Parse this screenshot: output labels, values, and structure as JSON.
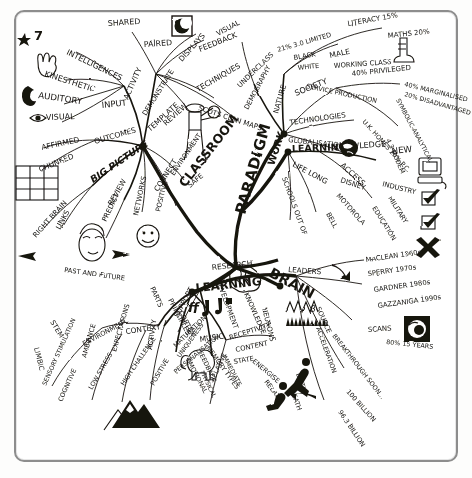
{
  "document": {
    "type": "hand-drawn-mind-map",
    "title": "PARADIGM",
    "ink_color": "#17140f",
    "paper_color": "#ffffff",
    "frame_color": "#8d8d8d"
  },
  "center": {
    "label": "PARADIGM"
  },
  "branches": [
    {
      "id": "classroom",
      "label": "CLASSROOM",
      "direction": "upper-left",
      "children": [
        "INTELLIGENCES",
        "7",
        "KINESTHETIC",
        "AUDITORY",
        "VISUAL",
        "INPUT",
        "ACTIVITY",
        "SHARED",
        "PAIRED",
        "DISPLAYS",
        "VISUAL",
        "FEEDBACK",
        "DEMONSTRATE",
        "REVIEW",
        "TECHNIQUES",
        "SCOTS CLAN MAPS",
        "AFFIRMED",
        "OUTCOMES",
        "CHUNKED",
        "BIG PICTURE",
        "RIGHT BRAIN",
        "LINKS",
        "REVIEW",
        "PREDICT",
        "NETWORKS",
        "CONNECT",
        "ENVIRONMENT",
        "POSITIVE",
        "SAFE",
        "TEMPLATE",
        "PAST AND FUTURE"
      ]
    },
    {
      "id": "work",
      "label": "WORK",
      "direction": "upper-right",
      "children": [
        "DEMOGRAPHY",
        "NATURE",
        "SOCIETY",
        "TECHNOLOGIES",
        "GLOBALISATION",
        "UNDERCLASS",
        "21% 3.0 LIMITED",
        "BLACK",
        "WHITE",
        "MALE",
        "WORKING CLASS",
        "LITERACY 15%",
        "MATHS 20%",
        "40% PRIVILEGED",
        "40% MARGINALISED",
        "20% DISADVANTAGED",
        "SERVICE PRODUCTION",
        "SYMBOLIC-ANALYTICAL",
        "U.K. HOMES 20% P.C.",
        "4.3 MODEM"
      ]
    },
    {
      "id": "learning-knowledge",
      "label": "LEARNING",
      "direction": "right",
      "children": [
        "KNOWLEDGE",
        "NEW",
        "ACCESS",
        "LIFE LONG",
        "SCHOOLS OUT OF",
        "DISNEY",
        "MOTOROLA",
        "BELL",
        "INDUSTRY",
        "MILITARY",
        "EDUCATION"
      ]
    },
    {
      "id": "brain",
      "label": "BRAIN",
      "direction": "lower-right",
      "children": [
        "PARTS",
        "STEM",
        "LIMBIC",
        "CORTEX",
        "DEVELOPMENT",
        "NEURONS",
        "RESEARCH",
        "LEADERS",
        "KNOWLEDGE",
        "MACLEAN 1960s",
        "SPERRY 1970s",
        "GARDNER 1980s",
        "GAZZANIGA 1990s",
        "SOURCE",
        "SCANS",
        "ACCELERATION",
        "BREAKTHROUGH SOON...",
        "80% 15 YEARS",
        "BIRTH",
        "DEATH",
        "100 BILLION",
        "96.3 BILLION"
      ]
    },
    {
      "id": "learning-principles",
      "label": "LEARNING",
      "direction": "lower-left",
      "children": [
        "PRINCIPLES",
        "CONTEXT",
        "ENVIRONMENT",
        "SENSORY STIMULATION",
        "COGNITIVE",
        "AMBIANCE",
        "LOW STRESS",
        "EXPECTATIONS",
        "HIGH CHALLENGE",
        "ACTIVITY",
        "POSITIVE",
        "SUPPORT",
        "MATURATION",
        "UNIQUENESS",
        "PERSONALISATION",
        "RELATIVE",
        "MUSIC",
        "RECEPTIVITY",
        "CONTENT",
        "STATE",
        "ENERGISE",
        "RELAX",
        "MEMORY TYPES",
        "IMMEDIATE",
        "FEEDBACK",
        "EMOTIONAL",
        "PHYSICAL"
      ]
    }
  ],
  "icons": [
    {
      "name": "moon-square-icon",
      "note": "framed crescent moon, top"
    },
    {
      "name": "globe-icon",
      "note": "framed earth globe, upper right"
    },
    {
      "name": "computer-icon",
      "note": "desktop monitor, right edge"
    },
    {
      "name": "check-mark-icon",
      "note": "tick in box, right edge"
    },
    {
      "name": "check-mark-icon-2",
      "note": "second tick in box"
    },
    {
      "name": "cross-icon",
      "note": "bold X, right edge"
    },
    {
      "name": "brain-scan-icon",
      "note": "framed brain scan, lower right"
    },
    {
      "name": "brain-icon",
      "note": "sketched brain beside BRAIN node"
    },
    {
      "name": "eye-icon",
      "note": "eye beside VISUAL"
    },
    {
      "name": "ear-icon",
      "note": "ear beside AUDITORY"
    },
    {
      "name": "hand-icon",
      "note": "hand beside KINESTHETIC"
    },
    {
      "name": "star-icon",
      "note": "star top left"
    },
    {
      "name": "puzzle-icon",
      "note": "jigsaw grid beside CHUNKED"
    },
    {
      "name": "smiley-face-icon",
      "note": "smiling face, centre left"
    },
    {
      "name": "face-icon",
      "note": "portrait face, past and future"
    },
    {
      "name": "piper-icon",
      "note": "scots piper figure"
    },
    {
      "name": "music-note-icon",
      "note": "ff and notes"
    },
    {
      "name": "waveform-icon",
      "note": "brainwave trace with beta symbol"
    },
    {
      "name": "elephant-icon",
      "note": "elephant, memory"
    },
    {
      "name": "runner-icon",
      "note": "running figures"
    },
    {
      "name": "mountain-icon",
      "note": "mountain range, challenge"
    },
    {
      "name": "boot-icon",
      "note": "boot, working class"
    },
    {
      "name": "plane-icon",
      "note": "aeroplane, right edge"
    }
  ]
}
